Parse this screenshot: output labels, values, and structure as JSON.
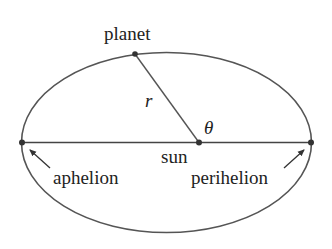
{
  "diagram": {
    "labels": {
      "planet": "planet",
      "radius": "r",
      "angle": "θ",
      "sun": "sun",
      "aphelion": "aphelion",
      "perihelion": "perihelion"
    },
    "colors": {
      "line": "#555555",
      "text": "#222222",
      "background": "#ffffff"
    }
  }
}
